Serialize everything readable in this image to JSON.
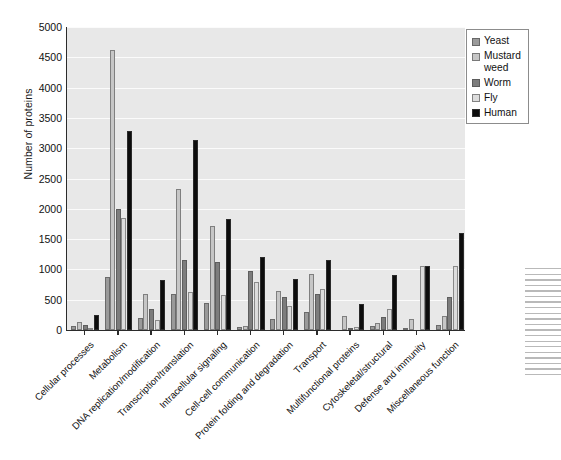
{
  "chart_data": {
    "type": "bar",
    "title": "",
    "xlabel": "",
    "ylabel": "Number of proteins",
    "ylim": [
      0,
      5000
    ],
    "ytick_step": 500,
    "yticks": [
      0,
      500,
      1000,
      1500,
      2000,
      2500,
      3000,
      3500,
      4000,
      4500,
      5000
    ],
    "grid": true,
    "legend_position": "top-right",
    "categories": [
      "Cellular processes",
      "Metabolism",
      "DNA replication/modification",
      "Transcription/translation",
      "Intracellular signaling",
      "Cell-cell communication",
      "Protein folding and degradation",
      "Transport",
      "Multifunctional proteins",
      "Cytoskeletal/structural",
      "Defense and immunity",
      "Miscellaneous function"
    ],
    "series": [
      {
        "name": "Yeast",
        "color": "#9a9a9a",
        "values": [
          60,
          870,
          200,
          600,
          450,
          50,
          180,
          300,
          0,
          60,
          20,
          80
        ]
      },
      {
        "name": "Mustard weed",
        "color": "#c6c6c6",
        "values": [
          130,
          4620,
          600,
          2330,
          1710,
          60,
          640,
          920,
          230,
          120,
          180,
          230
        ]
      },
      {
        "name": "Worm",
        "color": "#7d7d7d",
        "values": [
          80,
          1990,
          350,
          1160,
          1120,
          980,
          540,
          600,
          30,
          220,
          0,
          540
        ]
      },
      {
        "name": "Fly",
        "color": "#dcdcdc",
        "values": [
          40,
          1850,
          160,
          630,
          570,
          800,
          390,
          670,
          50,
          350,
          1050,
          1060
        ]
      },
      {
        "name": "Human",
        "color": "#0d0d0d",
        "values": [
          250,
          3280,
          820,
          3130,
          1830,
          1210,
          840,
          1150,
          430,
          900,
          1050,
          1600
        ]
      }
    ]
  },
  "legend": {
    "items": [
      {
        "label": "Yeast",
        "color": "#9a9a9a"
      },
      {
        "label": "Mustard\nweed",
        "color": "#c6c6c6"
      },
      {
        "label": "Worm",
        "color": "#7d7d7d"
      },
      {
        "label": "Fly",
        "color": "#dcdcdc"
      },
      {
        "label": "Human",
        "color": "#0d0d0d"
      }
    ]
  },
  "axis": {
    "y_title": "Number of proteins"
  }
}
